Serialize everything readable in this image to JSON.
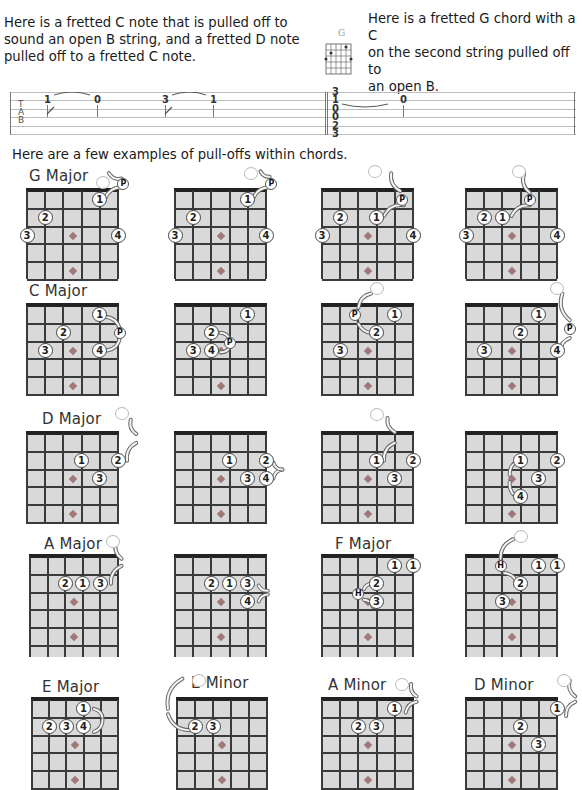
{
  "intro": {
    "left_text": [
      "Here is a fretted C note that is pulled off to",
      "sound an open B string, and a fretted  D note",
      "pulled off to a fretted C note."
    ],
    "right_text": [
      "Here is a fretted G chord with a C",
      "on the second string pulled off to",
      "an open B."
    ],
    "mini_chord_label": "G"
  },
  "tab": {
    "letters": [
      "T",
      "A",
      "B"
    ],
    "notes_left": [
      {
        "fret": "1",
        "x": 34,
        "string": 1
      },
      {
        "fret": "0",
        "x": 84,
        "string": 1
      },
      {
        "fret": "3",
        "x": 152,
        "string": 1
      },
      {
        "fret": "1",
        "x": 200,
        "string": 1
      }
    ],
    "chord_stack": [
      "3",
      "1",
      "0",
      "0",
      "2",
      "3"
    ],
    "chord_stack_x": 322,
    "note_right": {
      "fret": "0",
      "x": 390,
      "string": 1
    }
  },
  "section_title": "Here are a few examples of pull-offs within chords.",
  "colors": {
    "fretboard": "#d9d9d9",
    "lines": "#3a3a3a",
    "nut": "#222222",
    "inlay": "#a07878",
    "text": "#1a1a1a"
  },
  "chords": [
    {
      "title": "G Major",
      "x": 27,
      "y": 191,
      "w": 91,
      "h": 88,
      "titleDx": 2,
      "titleDy": -24,
      "fingers": [
        {
          "n": "1",
          "s": 4,
          "f": 1
        },
        {
          "n": "2",
          "s": 1,
          "f": 2
        },
        {
          "n": "3",
          "s": 0,
          "f": 3
        },
        {
          "n": "4",
          "s": 5,
          "f": 3
        }
      ],
      "open": [
        {
          "s": 4.2,
          "f": 0
        }
      ],
      "badge": {
        "t": "P",
        "s": 5.3,
        "f": 0.1
      },
      "arrows": [
        [
          4.3,
          0.9,
          5.3,
          0.3
        ],
        [
          5.2,
          -0.2,
          4.5,
          -0.5
        ]
      ]
    },
    {
      "title": "",
      "x": 175,
      "y": 191,
      "w": 91,
      "h": 88,
      "fingers": [
        {
          "n": "1",
          "s": 4,
          "f": 1
        },
        {
          "n": "2",
          "s": 1,
          "f": 2
        },
        {
          "n": "3",
          "s": 0,
          "f": 3
        },
        {
          "n": "4",
          "s": 5,
          "f": 3
        }
      ],
      "open": [
        {
          "s": 4.2,
          "f": -0.5
        }
      ],
      "badge": {
        "t": "P",
        "s": 5.3,
        "f": 0.1
      },
      "arrows": [
        [
          4.3,
          0.9,
          5.3,
          0.3
        ],
        [
          5.2,
          -0.3,
          4.7,
          -0.6
        ]
      ]
    },
    {
      "title": "",
      "x": 322,
      "y": 191,
      "w": 91,
      "h": 88,
      "fingers": [
        {
          "n": "1",
          "s": 3,
          "f": 2
        },
        {
          "n": "2",
          "s": 1,
          "f": 2
        },
        {
          "n": "3",
          "s": 0,
          "f": 3
        },
        {
          "n": "4",
          "s": 5,
          "f": 3
        }
      ],
      "open": [
        {
          "s": 2.9,
          "f": -0.6
        }
      ],
      "badge": {
        "t": "P",
        "s": 4.4,
        "f": 1
      },
      "arrows": [
        [
          3.4,
          1.9,
          4.5,
          1.3
        ],
        [
          4.3,
          0.5,
          3.8,
          -0.5
        ]
      ]
    },
    {
      "title": "",
      "x": 466,
      "y": 191,
      "w": 91,
      "h": 88,
      "fingers": [
        {
          "n": "1",
          "s": 2,
          "f": 2
        },
        {
          "n": "2",
          "s": 1,
          "f": 2
        },
        {
          "n": "3",
          "s": 0,
          "f": 3
        },
        {
          "n": "4",
          "s": 5,
          "f": 3
        }
      ],
      "open": [
        {
          "s": 2.9,
          "f": -0.6
        }
      ],
      "badge": {
        "t": "P",
        "s": 3.5,
        "f": 1
      },
      "arrows": [
        [
          2.5,
          1.9,
          3.5,
          1.3
        ],
        [
          3.5,
          0.6,
          3.2,
          -0.5
        ]
      ]
    },
    {
      "title": "C Major",
      "x": 27,
      "y": 306,
      "w": 91,
      "h": 90,
      "titleDx": 2,
      "titleDy": -24,
      "fingers": [
        {
          "n": "1",
          "s": 4,
          "f": 1
        },
        {
          "n": "2",
          "s": 2,
          "f": 2
        },
        {
          "n": "3",
          "s": 1,
          "f": 3
        },
        {
          "n": "4",
          "s": 4,
          "f": 3
        }
      ],
      "open": [],
      "badge": {
        "t": "P",
        "s": 5.1,
        "f": 2
      },
      "arrows": [
        [
          4.3,
          1.1,
          5.1,
          1.8
        ],
        [
          5.1,
          2.3,
          4.4,
          3
        ]
      ]
    },
    {
      "title": "",
      "x": 175,
      "y": 306,
      "w": 91,
      "h": 90,
      "fingers": [
        {
          "n": "1",
          "s": 4,
          "f": 1
        },
        {
          "n": "2",
          "s": 2,
          "f": 2
        },
        {
          "n": "3",
          "s": 1,
          "f": 3
        },
        {
          "n": "4",
          "s": 2,
          "f": 3
        }
      ],
      "open": [],
      "badge": {
        "t": "P",
        "s": 3,
        "f": 2.6
      },
      "arrows": [
        [
          2.5,
          2,
          3,
          2.4
        ],
        [
          3,
          2.8,
          2.5,
          3.1
        ]
      ]
    },
    {
      "title": "",
      "x": 322,
      "y": 306,
      "w": 91,
      "h": 90,
      "fingers": [
        {
          "n": "1",
          "s": 4,
          "f": 1
        },
        {
          "n": "2",
          "s": 3,
          "f": 2
        },
        {
          "n": "3",
          "s": 1,
          "f": 3
        }
      ],
      "open": [
        {
          "s": 3,
          "f": -0.5
        }
      ],
      "badge": {
        "t": "P",
        "s": 1.8,
        "f": 1
      },
      "arrows": [
        [
          2.9,
          2,
          2,
          1.5
        ],
        [
          2,
          0.6,
          2.7,
          -0.2
        ]
      ]
    },
    {
      "title": "",
      "x": 466,
      "y": 306,
      "w": 91,
      "h": 90,
      "fingers": [
        {
          "n": "1",
          "s": 4,
          "f": 1
        },
        {
          "n": "2",
          "s": 3,
          "f": 2
        },
        {
          "n": "3",
          "s": 1,
          "f": 3
        },
        {
          "n": "4",
          "s": 5,
          "f": 3
        }
      ],
      "open": [
        {
          "s": 5,
          "f": -0.5
        }
      ],
      "badge": {
        "t": "P",
        "s": 5.7,
        "f": 1.8
      },
      "arrows": [
        [
          5.2,
          3,
          5.7,
          2.3
        ],
        [
          5.7,
          1.3,
          5.3,
          -0.2
        ]
      ]
    },
    {
      "title": "D Major",
      "x": 27,
      "y": 434,
      "w": 91,
      "h": 90,
      "titleDx": 15,
      "titleDy": -24,
      "fingers": [
        {
          "n": "1",
          "s": 3,
          "f": 2
        },
        {
          "n": "2",
          "s": 5,
          "f": 2
        },
        {
          "n": "3",
          "s": 4,
          "f": 3
        }
      ],
      "open": [
        {
          "s": 5.2,
          "f": -0.7
        }
      ],
      "badge": null,
      "arrows": [
        [
          5.5,
          2,
          6,
          1
        ],
        [
          6,
          0.5,
          5.7,
          -0.3
        ]
      ]
    },
    {
      "title": "",
      "x": 175,
      "y": 434,
      "w": 91,
      "h": 90,
      "fingers": [
        {
          "n": "1",
          "s": 3,
          "f": 2
        },
        {
          "n": "2",
          "s": 5,
          "f": 2
        },
        {
          "n": "3",
          "s": 4,
          "f": 3
        },
        {
          "n": "4",
          "s": 5,
          "f": 3
        }
      ],
      "open": [],
      "badge": null,
      "arrows": [
        [
          5.4,
          3,
          5.9,
          2.5
        ],
        [
          5.9,
          2.5,
          5.4,
          2.1
        ]
      ]
    },
    {
      "title": "",
      "x": 322,
      "y": 434,
      "w": 91,
      "h": 90,
      "fingers": [
        {
          "n": "1",
          "s": 3,
          "f": 2
        },
        {
          "n": "2",
          "s": 5,
          "f": 2
        },
        {
          "n": "3",
          "s": 4,
          "f": 3
        }
      ],
      "open": [
        {
          "s": 3,
          "f": -0.6
        }
      ],
      "badge": null,
      "arrows": [
        [
          3.4,
          2,
          4,
          1
        ],
        [
          4,
          0.4,
          3.6,
          -0.4
        ]
      ]
    },
    {
      "title": "",
      "x": 466,
      "y": 434,
      "w": 91,
      "h": 90,
      "fingers": [
        {
          "n": "1",
          "s": 3,
          "f": 2
        },
        {
          "n": "2",
          "s": 5,
          "f": 2
        },
        {
          "n": "3",
          "s": 4,
          "f": 3
        },
        {
          "n": "4",
          "s": 3,
          "f": 4
        }
      ],
      "open": [],
      "badge": null,
      "arrows": [
        [
          2.9,
          4.1,
          2.4,
          3.2
        ],
        [
          2.4,
          2.8,
          2.9,
          2
        ]
      ]
    },
    {
      "title": "A Major",
      "x": 30,
      "y": 557,
      "w": 88,
      "h": 100,
      "titleDx": 14,
      "titleDy": -22,
      "fingers": [
        {
          "n": "2",
          "s": 2,
          "f": 2
        },
        {
          "n": "1",
          "s": 3,
          "f": 2
        },
        {
          "n": "3",
          "s": 4,
          "f": 2
        }
      ],
      "open": [
        {
          "s": 4.7,
          "f": -0.4
        }
      ],
      "badge": null,
      "arrows": [
        [
          4.6,
          2,
          5.2,
          1
        ],
        [
          5.2,
          0.6,
          4.9,
          -0.4
        ]
      ]
    },
    {
      "title": "",
      "x": 175,
      "y": 557,
      "w": 91,
      "h": 100,
      "fingers": [
        {
          "n": "2",
          "s": 2,
          "f": 2
        },
        {
          "n": "1",
          "s": 3,
          "f": 2
        },
        {
          "n": "3",
          "s": 4,
          "f": 2
        },
        {
          "n": "4",
          "s": 4,
          "f": 3
        }
      ],
      "open": [],
      "badge": null,
      "arrows": [
        [
          4.6,
          3,
          5.1,
          2.6
        ],
        [
          5.1,
          2.4,
          4.6,
          2.1
        ]
      ]
    },
    {
      "title": "F Major",
      "x": 322,
      "y": 557,
      "w": 91,
      "h": 100,
      "titleDx": 13,
      "titleDy": -22,
      "fingers": [
        {
          "n": "1",
          "s": 4,
          "f": 1
        },
        {
          "n": "1",
          "s": 5,
          "f": 1
        },
        {
          "n": "2",
          "s": 3,
          "f": 2
        },
        {
          "n": "3",
          "s": 3,
          "f": 3
        }
      ],
      "open": [],
      "badge": {
        "t": "H",
        "s": 2,
        "f": 2.6
      },
      "arrows": [
        [
          2.3,
          2.3,
          2.8,
          2
        ],
        [
          2.3,
          2.9,
          2.8,
          3.3
        ]
      ]
    },
    {
      "title": "",
      "x": 466,
      "y": 557,
      "w": 91,
      "h": 100,
      "fingers": [
        {
          "n": "1",
          "s": 4,
          "f": 1
        },
        {
          "n": "1",
          "s": 5,
          "f": 1
        },
        {
          "n": "2",
          "s": 3,
          "f": 2
        },
        {
          "n": "3",
          "s": 2,
          "f": 3
        }
      ],
      "open": [
        {
          "s": 3,
          "f": -0.7
        }
      ],
      "badge": {
        "t": "H",
        "s": 1.9,
        "f": 1
      },
      "arrows": [
        [
          1.9,
          0.6,
          2.6,
          -0.5
        ],
        [
          2.1,
          1.4,
          2.8,
          2
        ]
      ]
    },
    {
      "title": "E Major",
      "x": 32,
      "y": 700,
      "w": 86,
      "h": 90,
      "titleDx": 10,
      "titleDy": -22,
      "fingers": [
        {
          "n": "1",
          "s": 3,
          "f": 1
        },
        {
          "n": "2",
          "s": 1,
          "f": 2
        },
        {
          "n": "3",
          "s": 2,
          "f": 2
        },
        {
          "n": "4",
          "s": 3,
          "f": 2
        }
      ],
      "open": [],
      "badge": null,
      "arrows": [
        [
          3.6,
          1,
          4.1,
          1.5
        ],
        [
          4.1,
          1.6,
          3.6,
          2.3
        ]
      ]
    },
    {
      "title": "E Minor",
      "x": 177,
      "y": 700,
      "w": 90,
      "h": 90,
      "titleDx": 14,
      "titleDy": -26,
      "fingers": [
        {
          "n": "2",
          "s": 1,
          "f": 2
        },
        {
          "n": "3",
          "s": 2,
          "f": 2
        }
      ],
      "open": [
        {
          "s": 1.2,
          "f": -0.6
        }
      ],
      "badge": null,
      "arrows": [
        [
          0.7,
          2.2,
          -0.5,
          1.3
        ],
        [
          -0.5,
          1,
          0.3,
          -0.7
        ]
      ]
    },
    {
      "title": "A Minor",
      "x": 322,
      "y": 700,
      "w": 91,
      "h": 90,
      "titleDx": 6,
      "titleDy": -24,
      "fingers": [
        {
          "n": "1",
          "s": 4,
          "f": 1
        },
        {
          "n": "2",
          "s": 2,
          "f": 2
        },
        {
          "n": "3",
          "s": 3,
          "f": 2
        }
      ],
      "open": [
        {
          "s": 4.4,
          "f": -0.4
        }
      ],
      "badge": null,
      "arrows": [
        [
          4.6,
          1.2,
          5.2,
          0.6
        ],
        [
          5.2,
          0.3,
          4.9,
          -0.4
        ]
      ]
    },
    {
      "title": "D Minor",
      "x": 466,
      "y": 700,
      "w": 91,
      "h": 90,
      "titleDx": 8,
      "titleDy": -24,
      "fingers": [
        {
          "n": "1",
          "s": 5,
          "f": 1
        },
        {
          "n": "2",
          "s": 3,
          "f": 2
        },
        {
          "n": "3",
          "s": 4,
          "f": 3
        }
      ],
      "open": [
        {
          "s": 5.4,
          "f": -0.6
        }
      ],
      "badge": null,
      "arrows": [
        [
          5.5,
          1.4,
          6,
          0.6
        ],
        [
          6,
          0.3,
          5.7,
          -0.6
        ]
      ]
    }
  ]
}
